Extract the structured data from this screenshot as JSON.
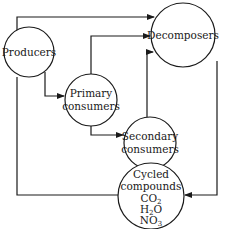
{
  "diagram": {
    "type": "flow",
    "title": "",
    "nodes": [
      {
        "id": "producers",
        "lines": [
          "Producers"
        ]
      },
      {
        "id": "primary",
        "lines": [
          "Primary",
          "consumers"
        ]
      },
      {
        "id": "secondary",
        "lines": [
          "Secondary",
          "consumers"
        ]
      },
      {
        "id": "decomposers",
        "lines": [
          "Decomposers"
        ]
      },
      {
        "id": "cycled",
        "lines": [
          "Cycled",
          "compounds"
        ],
        "formulas": [
          {
            "base": "CO",
            "sub": "2",
            "tail": ""
          },
          {
            "base": "H",
            "sub": "2",
            "tail": "O"
          },
          {
            "base": "NO",
            "sub": "3",
            "tail": ""
          }
        ]
      }
    ],
    "edges": [
      {
        "from": "producers",
        "to": "primary"
      },
      {
        "from": "producers",
        "to": "decomposers"
      },
      {
        "from": "primary",
        "to": "secondary"
      },
      {
        "from": "primary",
        "to": "decomposers"
      },
      {
        "from": "secondary",
        "to": "decomposers"
      },
      {
        "from": "decomposers",
        "to": "cycled"
      },
      {
        "from": "cycled",
        "to": "producers"
      }
    ]
  },
  "colors": {
    "stroke": "#1a1a1a",
    "background": "#ffffff"
  }
}
